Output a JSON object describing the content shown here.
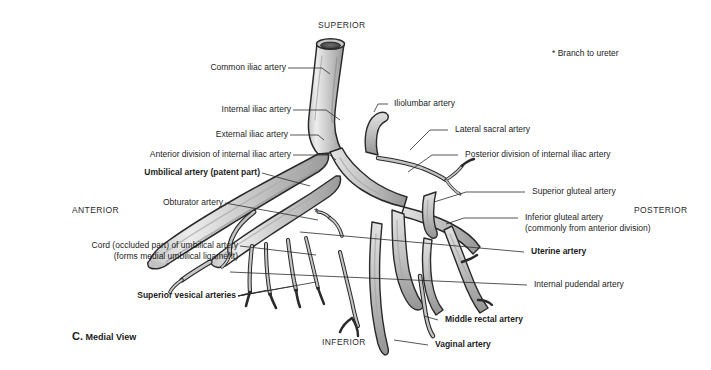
{
  "figure": {
    "caption_letter": "C.",
    "caption_text": "Medial View",
    "footnote": "* Branch to ureter",
    "asterisk_marker": "*"
  },
  "orientation": {
    "superior": "SUPERIOR",
    "inferior": "INFERIOR",
    "anterior": "ANTERIOR",
    "posterior": "POSTERIOR"
  },
  "labels_left": [
    {
      "text": "Common iliac artery",
      "bold": false
    },
    {
      "text": "Internal iliac artery",
      "bold": false
    },
    {
      "text": "External iliac artery",
      "bold": false
    },
    {
      "text": "Anterior division of internal iliac artery",
      "bold": false
    },
    {
      "text": "Umbilical artery (patent part)",
      "bold": true
    },
    {
      "text": "Obturator artery",
      "bold": false
    },
    {
      "text": "Cord (occluded part) of umbilical artery",
      "bold": false
    },
    {
      "text": "(forms medial umbilical ligament)",
      "bold": false
    },
    {
      "text": "Superior vesical arteries",
      "bold": true
    }
  ],
  "labels_right": [
    {
      "text": "Iliolumbar artery",
      "bold": false
    },
    {
      "text": "Lateral sacral artery",
      "bold": false
    },
    {
      "text": "Posterior division of internal iliac artery",
      "bold": false
    },
    {
      "text": "Superior gluteal artery",
      "bold": false
    },
    {
      "text": "Inferior gluteal artery",
      "bold": false
    },
    {
      "text": "(commonly from anterior division)",
      "bold": false
    },
    {
      "text": "Uterine artery",
      "bold": true
    },
    {
      "text": "Internal pudendal artery",
      "bold": false
    },
    {
      "text": "Middle rectal artery",
      "bold": true
    },
    {
      "text": "Vaginal artery",
      "bold": true
    }
  ],
  "colors": {
    "vessel_light": "#dcdcdc",
    "vessel_mid": "#b4b4b4",
    "vessel_dark": "#8d8d8d",
    "outline": "#2a2a2a",
    "leader": "#2b2b2b",
    "background": "#ffffff",
    "text": "#1d1d1d"
  }
}
